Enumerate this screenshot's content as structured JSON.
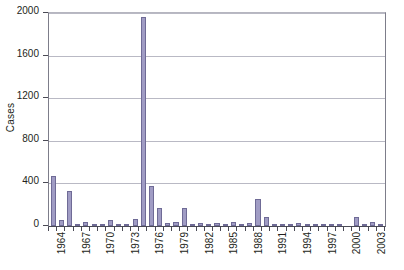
{
  "chart_data": {
    "type": "bar",
    "title": "",
    "subtitle": "",
    "xlabel": "",
    "ylabel": "Cases",
    "ylim": [
      0,
      2000
    ],
    "ytick_labels": [
      "0",
      "400",
      "800",
      "1200",
      "1600",
      "2000"
    ],
    "ytick_values": [
      0,
      400,
      800,
      1200,
      1600,
      2000
    ],
    "grid": true,
    "legend": null,
    "xtick_labels": [
      "1964",
      "1967",
      "1970",
      "1973",
      "1976",
      "1979",
      "1982",
      "1985",
      "1988",
      "1991",
      "1994",
      "1997",
      "2000",
      "2003"
    ],
    "bar_color": "#a09cc4",
    "bar_border_color": "#6f6b96",
    "categories": [
      "1964",
      "1965",
      "1966",
      "1967",
      "1968",
      "1969",
      "1970",
      "1971",
      "1972",
      "1973",
      "1974",
      "1975",
      "1976",
      "1977",
      "1978",
      "1979",
      "1980",
      "1981",
      "1982",
      "1983",
      "1984",
      "1985",
      "1986",
      "1987",
      "1988",
      "1989",
      "1990",
      "1991",
      "1992",
      "1993",
      "1994",
      "1995",
      "1996",
      "1997",
      "1998",
      "1999",
      "2000",
      "2001",
      "2002",
      "2003",
      "2004"
    ],
    "values": [
      470,
      60,
      325,
      10,
      35,
      15,
      12,
      55,
      8,
      5,
      70,
      1960,
      380,
      165,
      25,
      35,
      170,
      8,
      28,
      12,
      25,
      18,
      40,
      5,
      30,
      250,
      80,
      12,
      15,
      10,
      25,
      5,
      8,
      20,
      4,
      3,
      0,
      80,
      18,
      40,
      10
    ]
  }
}
